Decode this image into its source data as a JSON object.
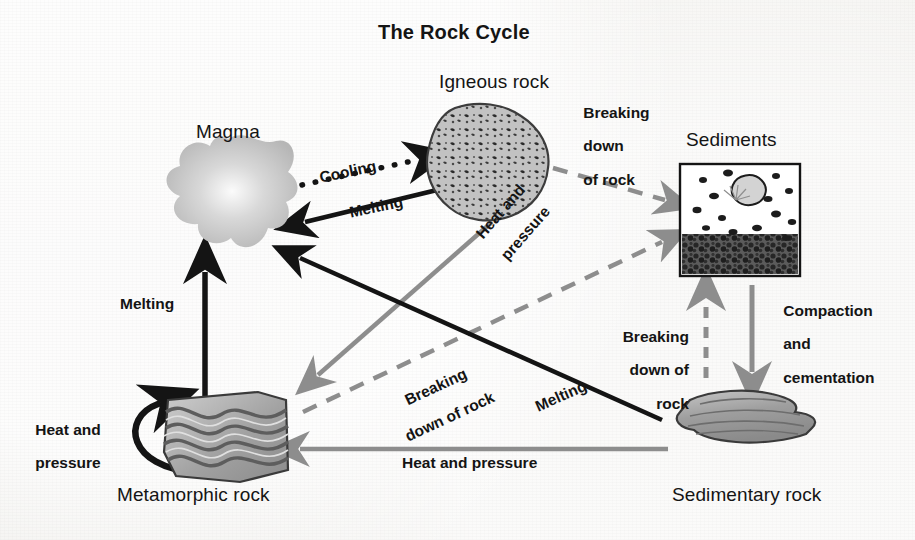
{
  "diagram": {
    "title": "The Rock Cycle",
    "type": "cycle-diagram",
    "background_color": "#f2f1ee",
    "ink_color": "#141414",
    "gray_color": "#8d8d8d",
    "nodes": [
      {
        "id": "magma",
        "label": "Magma",
        "shape": "irregular-blob",
        "fill": "#c9c9c9"
      },
      {
        "id": "igneous",
        "label": "Igneous rock",
        "shape": "speckled-boulder",
        "fill": "#b9b9b9"
      },
      {
        "id": "sediments",
        "label": "Sediments",
        "shape": "framed-box-with-grains",
        "fill": "#ffffff"
      },
      {
        "id": "sedimentary",
        "label": "Sedimentary rock",
        "shape": "layered-slab",
        "fill": "#a8a8a8"
      },
      {
        "id": "metamorphic",
        "label": "Metamorphic rock",
        "shape": "folded-banded-block",
        "fill": "#a9a9a9"
      }
    ],
    "edges": [
      {
        "id": "magma-to-igneous",
        "label": "Cooling",
        "from": "magma",
        "to": "igneous",
        "style": "dotted",
        "color": "#141414"
      },
      {
        "id": "igneous-to-magma",
        "label": "Melting",
        "from": "igneous",
        "to": "magma",
        "style": "solid",
        "color": "#141414"
      },
      {
        "id": "igneous-to-sediments",
        "label": "Breaking\ndown\nof rock",
        "from": "igneous",
        "to": "sediments",
        "style": "dashed",
        "color": "#8d8d8d"
      },
      {
        "id": "igneous-to-metamorphic",
        "label": "Heat and\npressure",
        "from": "igneous",
        "to": "metamorphic",
        "style": "solid",
        "color": "#8d8d8d"
      },
      {
        "id": "sediments-to-sedimentary",
        "label": "Compaction\nand\ncementation",
        "from": "sediments",
        "to": "sedimentary",
        "style": "solid",
        "color": "#8d8d8d"
      },
      {
        "id": "sedimentary-to-sediments",
        "label": "Breaking\ndown of\nrock",
        "from": "sedimentary",
        "to": "sediments",
        "style": "dashed",
        "color": "#8d8d8d"
      },
      {
        "id": "sedimentary-to-magma",
        "label": "Melting",
        "from": "sedimentary",
        "to": "magma",
        "style": "solid",
        "color": "#141414"
      },
      {
        "id": "sedimentary-to-metamorphic",
        "label": "Heat and pressure",
        "from": "sedimentary",
        "to": "metamorphic",
        "style": "solid",
        "color": "#8d8d8d"
      },
      {
        "id": "metamorphic-to-sediments",
        "label": "Breaking\ndown of rock",
        "from": "metamorphic",
        "to": "sediments",
        "style": "dashed",
        "color": "#8d8d8d"
      },
      {
        "id": "metamorphic-to-magma",
        "label": "Melting",
        "from": "metamorphic",
        "to": "magma",
        "style": "solid",
        "color": "#141414"
      },
      {
        "id": "metamorphic-self",
        "label": "Heat and\npressure",
        "from": "metamorphic",
        "to": "metamorphic",
        "style": "solid-curved",
        "color": "#141414"
      }
    ],
    "labels": {
      "title": "The Rock Cycle",
      "magma": "Magma",
      "igneous": "Igneous rock",
      "sediments": "Sediments",
      "sedimentary": "Sedimentary rock",
      "metamorphic": "Metamorphic rock",
      "cooling": "Cooling",
      "melting_igneous": "Melting",
      "breaking_top_l1": "Breaking",
      "breaking_top_l2": "down",
      "breaking_top_l3": "of rock",
      "heat_pressure_diag_l1": "Heat and",
      "heat_pressure_diag_l2": "pressure",
      "compaction_l1": "Compaction",
      "compaction_l2": "and",
      "compaction_l3": "cementation",
      "breaking_right_l1": "Breaking",
      "breaking_right_l2": "down of",
      "breaking_right_l3": "rock",
      "breaking_diag_l1": "Breaking",
      "breaking_diag_l2": "down of rock",
      "melting_diag": "Melting",
      "heat_pressure_bottom": "Heat and pressure",
      "melting_left": "Melting",
      "heat_pressure_left_l1": "Heat and",
      "heat_pressure_left_l2": "pressure"
    }
  }
}
